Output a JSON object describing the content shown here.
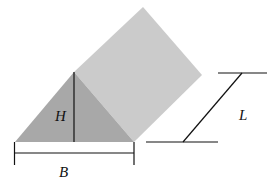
{
  "figure": {
    "colors": {
      "front_face": "#a8a8a8",
      "side_face": "#cbcbcb",
      "lines": "#111111",
      "background": "#ffffff"
    }
  },
  "labels": {
    "height": "H",
    "base": "B",
    "length": "L"
  }
}
